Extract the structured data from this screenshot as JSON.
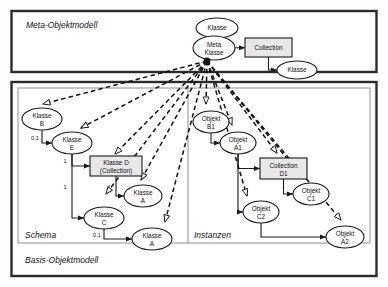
{
  "figure": {
    "outer_label": "Basis-Objektmodell",
    "meta_label": "Meta-Objektmodell",
    "schema_label": "Schema",
    "instances_label": "Instanzen"
  },
  "colors": {
    "stroke": "#1a1a1a",
    "box_fill": "#e8e8e8",
    "ellipse_fill": "#ffffff",
    "frame": "#2b2b2b",
    "inner_frame": "#8d8d8d"
  },
  "meta_model": {
    "nodes": [
      {
        "id": "m_klasse",
        "kind": "ellipse",
        "label": "Klasse",
        "line2": "",
        "cx": 217,
        "cy": 28,
        "rx": 21,
        "ry": 10
      },
      {
        "id": "m_meta",
        "kind": "ellipse",
        "label": "Meta",
        "line2": "Klasse",
        "cx": 214,
        "cy": 48,
        "rx": 21,
        "ry": 12
      },
      {
        "id": "m_coll",
        "kind": "rect",
        "label": "Collection",
        "line2": "",
        "x": 245,
        "y": 38,
        "w": 47,
        "h": 19
      },
      {
        "id": "m_klasse2",
        "kind": "ellipse",
        "label": "Klasse",
        "line2": "",
        "cx": 297,
        "cy": 70,
        "rx": 20,
        "ry": 9
      }
    ],
    "edges": [
      {
        "from": "m_klasse",
        "to": "m_meta",
        "label": ""
      },
      {
        "from": "m_meta",
        "to": "m_coll",
        "label": ""
      },
      {
        "from": "m_coll",
        "to": "m_klasse2",
        "label": ""
      }
    ]
  },
  "schema": {
    "nodes": [
      {
        "id": "s_b",
        "kind": "ellipse",
        "label": "Klasse",
        "line2": "B",
        "cx": 42,
        "cy": 119,
        "rx": 20,
        "ry": 11
      },
      {
        "id": "s_e",
        "kind": "ellipse",
        "label": "Klasse",
        "line2": "E",
        "cx": 72,
        "cy": 143,
        "rx": 20,
        "ry": 11
      },
      {
        "id": "s_d",
        "kind": "rect",
        "label": "Klasse D",
        "line2": "(Collection)",
        "x": 90,
        "y": 156,
        "w": 52,
        "h": 20
      },
      {
        "id": "s_a1",
        "kind": "ellipse",
        "label": "Klasse",
        "line2": "A",
        "cx": 143,
        "cy": 196,
        "rx": 19,
        "ry": 11
      },
      {
        "id": "s_c",
        "kind": "ellipse",
        "label": "Klasse",
        "line2": "C",
        "cx": 104,
        "cy": 218,
        "rx": 20,
        "ry": 11
      },
      {
        "id": "s_a2",
        "kind": "ellipse",
        "label": "Klasse",
        "line2": "A",
        "cx": 152,
        "cy": 239,
        "rx": 20,
        "ry": 11
      }
    ],
    "edges": [
      {
        "from": "s_b",
        "to": "s_e",
        "label": "0,1"
      },
      {
        "from": "s_e",
        "to": "s_d",
        "label": "1"
      },
      {
        "from": "s_e",
        "to": "s_c",
        "label": "1"
      },
      {
        "from": "s_d",
        "to": "s_a1",
        "label": "*"
      },
      {
        "from": "s_c",
        "to": "s_a2",
        "label": "0,1"
      }
    ]
  },
  "instances": {
    "nodes": [
      {
        "id": "i_b1",
        "kind": "ellipse",
        "label": "Objekt",
        "line2": "B1",
        "cx": 211,
        "cy": 122,
        "rx": 18,
        "ry": 11
      },
      {
        "id": "i_a1",
        "kind": "ellipse",
        "label": "Objekt",
        "line2": "A1",
        "cx": 238,
        "cy": 143,
        "rx": 18,
        "ry": 11
      },
      {
        "id": "i_d1",
        "kind": "rect",
        "label": "Collection",
        "line2": "D1",
        "x": 260,
        "y": 158,
        "w": 47,
        "h": 21
      },
      {
        "id": "i_c1",
        "kind": "ellipse",
        "label": "Objekt",
        "line2": "C1",
        "cx": 311,
        "cy": 194,
        "rx": 18,
        "ry": 11
      },
      {
        "id": "i_c2",
        "kind": "ellipse",
        "label": "Objekt",
        "line2": "C2",
        "cx": 261,
        "cy": 212,
        "rx": 18,
        "ry": 11
      },
      {
        "id": "i_a2",
        "kind": "ellipse",
        "label": "Objekt",
        "line2": "A2",
        "cx": 345,
        "cy": 237,
        "rx": 19,
        "ry": 11
      }
    ],
    "edges": [
      {
        "from": "i_b1",
        "to": "i_a1",
        "label": ""
      },
      {
        "from": "i_a1",
        "to": "i_d1",
        "label": ""
      },
      {
        "from": "i_a1",
        "to": "i_c2",
        "label": ""
      },
      {
        "from": "i_d1",
        "to": "i_c1",
        "label": ""
      },
      {
        "from": "i_c2",
        "to": "i_a2",
        "label": ""
      }
    ]
  },
  "instantiation": {
    "hub": {
      "x": 207,
      "y": 61
    },
    "targets": [
      {
        "to": "s_b",
        "tip_x": 43,
        "tip_y": 104
      },
      {
        "to": "s_e",
        "tip_x": 81,
        "tip_y": 128
      },
      {
        "to": "s_d",
        "tip_x": 115,
        "tip_y": 154
      },
      {
        "to": "s_c",
        "tip_x": 106,
        "tip_y": 194
      },
      {
        "to": "s_a1",
        "tip_x": 141,
        "tip_y": 180
      },
      {
        "to": "s_a2",
        "tip_x": 165,
        "tip_y": 222
      },
      {
        "to": "i_b1",
        "tip_x": 206,
        "tip_y": 104
      },
      {
        "to": "i_a1",
        "tip_x": 232,
        "tip_y": 125
      },
      {
        "to": "i_d1",
        "tip_x": 277,
        "tip_y": 153
      },
      {
        "to": "i_c1",
        "tip_x": 303,
        "tip_y": 178
      },
      {
        "to": "i_c2",
        "tip_x": 247,
        "tip_y": 196
      },
      {
        "to": "i_a2",
        "tip_x": 341,
        "tip_y": 220
      }
    ]
  }
}
